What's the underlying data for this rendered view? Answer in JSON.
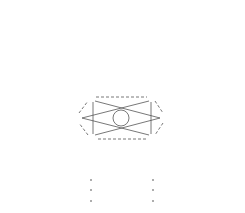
{
  "rows": [
    [
      "1"
    ],
    [
      "1",
      "1"
    ],
    [
      "1",
      "2",
      "1"
    ],
    [
      "1",
      "3",
      "3",
      "1"
    ],
    [
      "1",
      "4",
      "6",
      "4",
      "1"
    ],
    [
      "1",
      "5",
      "10",
      "10",
      "5",
      "1"
    ],
    [
      "1",
      "6",
      "15",
      "20",
      "15",
      "6",
      "1"
    ],
    [
      "1",
      "7",
      "21",
      "35",
      "35",
      "21",
      "7",
      "1"
    ]
  ],
  "highlight": {
    "center": "10",
    "hexagon": [
      "4",
      "6",
      "10",
      "20",
      "15",
      "5"
    ],
    "triangle_a": [
      "4",
      "10",
      "15"
    ],
    "triangle_b": [
      "6",
      "20",
      "5"
    ]
  },
  "continuation": "⋮",
  "colors": {
    "text": "#2a2a2a",
    "lines": "#555555"
  }
}
